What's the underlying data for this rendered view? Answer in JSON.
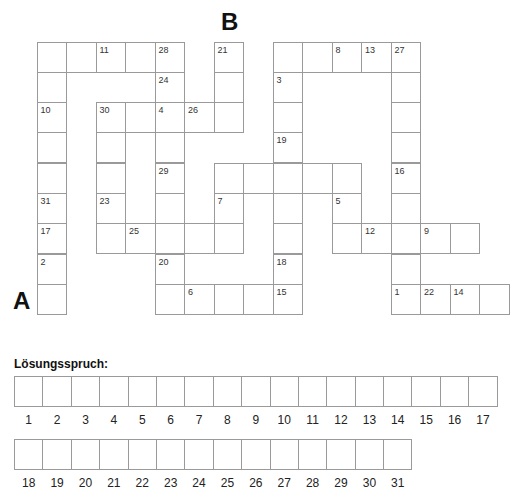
{
  "labels": {
    "start": "A",
    "end": "B"
  },
  "grid": {
    "origin_x": 37,
    "origin_y": 42,
    "cell_w": 29.5,
    "cell_h": 30.3,
    "cells": [
      {
        "c": 0,
        "r": 0,
        "n": ""
      },
      {
        "c": 1,
        "r": 0,
        "n": ""
      },
      {
        "c": 2,
        "r": 0,
        "n": "11"
      },
      {
        "c": 3,
        "r": 0,
        "n": ""
      },
      {
        "c": 4,
        "r": 0,
        "n": "28"
      },
      {
        "c": 6,
        "r": 0,
        "n": "21"
      },
      {
        "c": 8,
        "r": 0,
        "n": ""
      },
      {
        "c": 9,
        "r": 0,
        "n": ""
      },
      {
        "c": 10,
        "r": 0,
        "n": "8"
      },
      {
        "c": 11,
        "r": 0,
        "n": "13"
      },
      {
        "c": 12,
        "r": 0,
        "n": "27"
      },
      {
        "c": 0,
        "r": 1,
        "n": ""
      },
      {
        "c": 4,
        "r": 1,
        "n": "24"
      },
      {
        "c": 6,
        "r": 1,
        "n": ""
      },
      {
        "c": 8,
        "r": 1,
        "n": "3"
      },
      {
        "c": 12,
        "r": 1,
        "n": ""
      },
      {
        "c": 0,
        "r": 2,
        "n": "10"
      },
      {
        "c": 2,
        "r": 2,
        "n": "30"
      },
      {
        "c": 3,
        "r": 2,
        "n": ""
      },
      {
        "c": 4,
        "r": 2,
        "n": "4"
      },
      {
        "c": 5,
        "r": 2,
        "n": "26"
      },
      {
        "c": 6,
        "r": 2,
        "n": ""
      },
      {
        "c": 8,
        "r": 2,
        "n": ""
      },
      {
        "c": 12,
        "r": 2,
        "n": ""
      },
      {
        "c": 0,
        "r": 3,
        "n": ""
      },
      {
        "c": 2,
        "r": 3,
        "n": ""
      },
      {
        "c": 4,
        "r": 3,
        "n": ""
      },
      {
        "c": 8,
        "r": 3,
        "n": "19"
      },
      {
        "c": 12,
        "r": 3,
        "n": ""
      },
      {
        "c": 0,
        "r": 4,
        "n": ""
      },
      {
        "c": 2,
        "r": 4,
        "n": ""
      },
      {
        "c": 4,
        "r": 4,
        "n": "29"
      },
      {
        "c": 6,
        "r": 4,
        "n": ""
      },
      {
        "c": 7,
        "r": 4,
        "n": ""
      },
      {
        "c": 8,
        "r": 4,
        "n": ""
      },
      {
        "c": 9,
        "r": 4,
        "n": ""
      },
      {
        "c": 10,
        "r": 4,
        "n": ""
      },
      {
        "c": 12,
        "r": 4,
        "n": "16"
      },
      {
        "c": 0,
        "r": 5,
        "n": "31"
      },
      {
        "c": 2,
        "r": 5,
        "n": "23"
      },
      {
        "c": 4,
        "r": 5,
        "n": ""
      },
      {
        "c": 6,
        "r": 5,
        "n": "7"
      },
      {
        "c": 8,
        "r": 5,
        "n": ""
      },
      {
        "c": 10,
        "r": 5,
        "n": "5"
      },
      {
        "c": 12,
        "r": 5,
        "n": ""
      },
      {
        "c": 0,
        "r": 6,
        "n": "17"
      },
      {
        "c": 2,
        "r": 6,
        "n": ""
      },
      {
        "c": 3,
        "r": 6,
        "n": "25"
      },
      {
        "c": 4,
        "r": 6,
        "n": ""
      },
      {
        "c": 5,
        "r": 6,
        "n": ""
      },
      {
        "c": 6,
        "r": 6,
        "n": ""
      },
      {
        "c": 8,
        "r": 6,
        "n": ""
      },
      {
        "c": 10,
        "r": 6,
        "n": ""
      },
      {
        "c": 11,
        "r": 6,
        "n": "12"
      },
      {
        "c": 12,
        "r": 6,
        "n": ""
      },
      {
        "c": 13,
        "r": 6,
        "n": "9"
      },
      {
        "c": 14,
        "r": 6,
        "n": ""
      },
      {
        "c": 0,
        "r": 7,
        "n": "2"
      },
      {
        "c": 4,
        "r": 7,
        "n": "20"
      },
      {
        "c": 8,
        "r": 7,
        "n": "18"
      },
      {
        "c": 12,
        "r": 7,
        "n": ""
      },
      {
        "c": 0,
        "r": 8,
        "n": ""
      },
      {
        "c": 4,
        "r": 8,
        "n": ""
      },
      {
        "c": 5,
        "r": 8,
        "n": "6"
      },
      {
        "c": 6,
        "r": 8,
        "n": ""
      },
      {
        "c": 7,
        "r": 8,
        "n": ""
      },
      {
        "c": 8,
        "r": 8,
        "n": "15"
      },
      {
        "c": 12,
        "r": 8,
        "n": "1"
      },
      {
        "c": 13,
        "r": 8,
        "n": "22"
      },
      {
        "c": 14,
        "r": 8,
        "n": "14"
      },
      {
        "c": 15,
        "r": 8,
        "n": ""
      }
    ]
  },
  "solution": {
    "title": "Lösungsspruch:",
    "row1": [
      "1",
      "2",
      "3",
      "4",
      "5",
      "6",
      "7",
      "8",
      "9",
      "10",
      "11",
      "12",
      "13",
      "14",
      "15",
      "16",
      "17"
    ],
    "row2": [
      "18",
      "19",
      "20",
      "21",
      "22",
      "23",
      "24",
      "25",
      "26",
      "27",
      "28",
      "29",
      "30",
      "31"
    ]
  }
}
